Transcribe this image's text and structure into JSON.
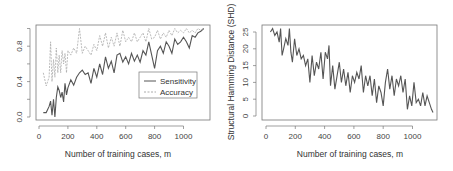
{
  "chart_data": [
    {
      "type": "line",
      "title": "",
      "xlabel": "Number of training cases, m",
      "ylabel": "",
      "xlim": [
        0,
        1150
      ],
      "ylim": [
        0.0,
        1.0
      ],
      "xticks": [
        "0",
        "200",
        "400",
        "600",
        "800",
        "1000"
      ],
      "yticks": [
        "0.0",
        "0.4",
        "0.8"
      ],
      "legend": {
        "position": "right-center",
        "entries": [
          "Sensitivity",
          "Accuracy"
        ]
      },
      "grid": false,
      "x": [
        30,
        50,
        70,
        80,
        90,
        100,
        110,
        120,
        130,
        140,
        150,
        160,
        170,
        180,
        190,
        200,
        220,
        240,
        260,
        280,
        300,
        320,
        340,
        360,
        380,
        400,
        420,
        440,
        460,
        480,
        500,
        520,
        540,
        560,
        580,
        600,
        620,
        640,
        660,
        680,
        700,
        720,
        740,
        760,
        780,
        800,
        820,
        840,
        860,
        880,
        900,
        920,
        940,
        960,
        980,
        1000,
        1020,
        1040,
        1060,
        1080,
        1100,
        1120,
        1140
      ],
      "series": [
        {
          "name": "Sensitivity",
          "style": "solid",
          "values": [
            0.05,
            0.05,
            0.12,
            0.18,
            0.02,
            0.2,
            0.0,
            0.22,
            0.34,
            0.3,
            0.22,
            0.28,
            0.17,
            0.38,
            0.25,
            0.33,
            0.42,
            0.36,
            0.45,
            0.5,
            0.53,
            0.48,
            0.5,
            0.38,
            0.55,
            0.45,
            0.6,
            0.48,
            0.68,
            0.55,
            0.63,
            0.5,
            0.7,
            0.72,
            0.62,
            0.68,
            0.6,
            0.72,
            0.63,
            0.7,
            0.62,
            0.75,
            0.7,
            0.85,
            0.7,
            0.55,
            0.75,
            0.8,
            0.72,
            0.85,
            0.8,
            0.72,
            0.88,
            0.82,
            0.85,
            0.9,
            0.85,
            0.78,
            0.92,
            0.9,
            0.95,
            0.97,
            1.0
          ]
        },
        {
          "name": "Accuracy",
          "style": "dashed",
          "values": [
            0.5,
            0.35,
            0.45,
            0.85,
            0.4,
            0.65,
            0.45,
            0.78,
            0.5,
            0.7,
            0.5,
            0.75,
            0.6,
            0.72,
            0.5,
            0.75,
            0.7,
            0.78,
            0.72,
            1.0,
            0.72,
            0.8,
            0.75,
            0.7,
            0.82,
            0.75,
            0.92,
            0.8,
            0.95,
            0.78,
            0.9,
            0.8,
            0.95,
            0.8,
            0.98,
            0.85,
            0.9,
            0.85,
            0.95,
            0.85,
            0.9,
            0.95,
            0.85,
            1.0,
            0.88,
            0.9,
            0.98,
            0.88,
            0.95,
            0.9,
            0.98,
            0.92,
            1.0,
            0.95,
            0.98,
            0.95,
            1.0,
            0.95,
            0.98,
            0.95,
            1.0,
            0.98,
            1.0
          ]
        }
      ]
    },
    {
      "type": "line",
      "title": "",
      "xlabel": "Number of training cases, m",
      "ylabel": "Structural Hamming Distance (SHD)",
      "xlim": [
        0,
        1150
      ],
      "ylim": [
        0,
        26
      ],
      "xticks": [
        "0",
        "200",
        "400",
        "600",
        "800",
        "1000"
      ],
      "yticks": [
        "0",
        "5",
        "10",
        "15",
        "20",
        "25"
      ],
      "grid": false,
      "x": [
        30,
        45,
        60,
        75,
        90,
        100,
        110,
        120,
        135,
        150,
        160,
        170,
        180,
        195,
        210,
        225,
        240,
        255,
        270,
        285,
        300,
        315,
        330,
        345,
        360,
        375,
        390,
        405,
        420,
        430,
        440,
        455,
        470,
        485,
        500,
        515,
        530,
        545,
        560,
        575,
        590,
        605,
        620,
        635,
        650,
        665,
        680,
        695,
        710,
        725,
        740,
        755,
        770,
        785,
        800,
        815,
        830,
        845,
        860,
        875,
        890,
        905,
        920,
        935,
        950,
        965,
        980,
        995,
        1010,
        1025,
        1040,
        1055,
        1070,
        1085,
        1100,
        1115,
        1130,
        1140
      ],
      "series": [
        {
          "name": "SHD",
          "style": "solid",
          "values": [
            25,
            26,
            24,
            25,
            22,
            26,
            18,
            20,
            23,
            21,
            26,
            19,
            16,
            23,
            18,
            20,
            17,
            18,
            15,
            17,
            10,
            18,
            12,
            16,
            14,
            19,
            11,
            19,
            17,
            21,
            9,
            15,
            8,
            12,
            16,
            10,
            14,
            9,
            13,
            7,
            12,
            10,
            13,
            11,
            15,
            7,
            12,
            9,
            12,
            6,
            11,
            4,
            9,
            7,
            3,
            10,
            14,
            8,
            12,
            6,
            11,
            9,
            12,
            7,
            11,
            2,
            6,
            3,
            10,
            4,
            5,
            3,
            7,
            3,
            6,
            4,
            2,
            1
          ]
        }
      ]
    }
  ],
  "left_chart": {
    "xlabel": "Number of training cases, m",
    "yticks": [
      "0.0",
      "0.4",
      "0.8"
    ],
    "xticks": [
      "0",
      "200",
      "400",
      "600",
      "800",
      "1000"
    ],
    "legend": {
      "sensitivity": "Sensitivity",
      "accuracy": "Accuracy"
    }
  },
  "right_chart": {
    "xlabel": "Number of training cases, m",
    "ylabel": "Structural Hamming Distance (SHD)",
    "yticks": [
      "0",
      "5",
      "10",
      "15",
      "20",
      "25"
    ],
    "xticks": [
      "0",
      "200",
      "400",
      "600",
      "800",
      "1000"
    ]
  },
  "colors": {
    "sensitivity": "#555555",
    "accuracy": "#aaaaaa",
    "shd": "#555555",
    "axis": "#555555"
  }
}
